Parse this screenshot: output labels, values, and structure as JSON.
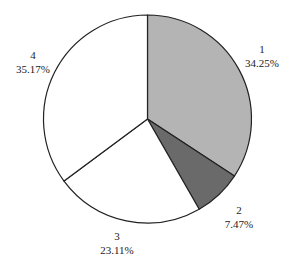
{
  "chart_data": {
    "type": "pie",
    "title": "",
    "categories": [
      "1",
      "2",
      "3",
      "4"
    ],
    "values": [
      34.25,
      7.47,
      23.11,
      35.17
    ],
    "labels": [
      "34.25%",
      "7.47%",
      "23.11%",
      "35.17%"
    ],
    "colors": [
      "#b4b4b4",
      "#6a6a6a",
      "#ffffff",
      "#ffffff"
    ],
    "start_angle_deg": 90,
    "direction": "clockwise",
    "legend": "none"
  },
  "slices": [
    {
      "name": "1",
      "pct": "34.25%"
    },
    {
      "name": "2",
      "pct": "7.47%"
    },
    {
      "name": "3",
      "pct": "23.11%"
    },
    {
      "name": "4",
      "pct": "35.17%"
    }
  ]
}
